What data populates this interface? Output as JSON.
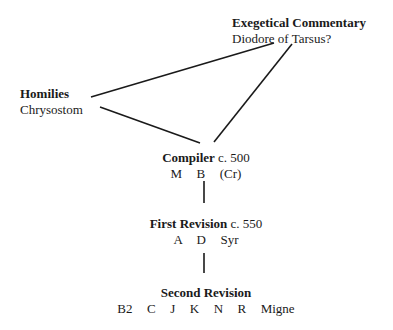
{
  "diagram": {
    "type": "stemma",
    "nodes": [
      {
        "id": "commentary",
        "title": "Exegetical Commentary",
        "date": "",
        "subtitle": "Diodore of Tarsus?"
      },
      {
        "id": "homilies",
        "title": "Homilies",
        "date": "",
        "subtitle": "Chrysostom"
      },
      {
        "id": "compiler",
        "title": "Compiler",
        "date": " c. 500",
        "subtitle": "M  B  (Cr)"
      },
      {
        "id": "first_revision",
        "title": "First Revision",
        "date": " c. 550",
        "subtitle": "A  D  Syr"
      },
      {
        "id": "second_revision",
        "title": "Second Revision",
        "date": "",
        "subtitle": "B2  C  J  K  N  R  Migne"
      }
    ],
    "edges": [
      {
        "from": "homilies",
        "to": "commentary"
      },
      {
        "from": "homilies",
        "to": "compiler"
      },
      {
        "from": "commentary",
        "to": "compiler"
      },
      {
        "from": "compiler",
        "to": "first_revision"
      },
      {
        "from": "first_revision",
        "to": "second_revision"
      }
    ]
  }
}
